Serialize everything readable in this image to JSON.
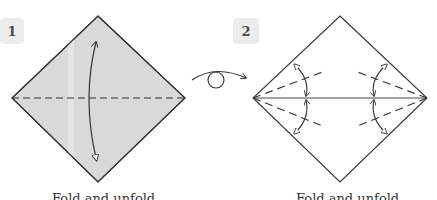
{
  "steps": [
    {
      "number": "1",
      "caption": "Fold and unfold",
      "paper_color": "#d9d9d9",
      "description": "Colored square diamond with horizontal valley-fold dashed line and a two-headed arrow indicating fold and unfold"
    },
    {
      "number": "2",
      "caption": "Fold and unfold",
      "paper_color": "#ffffff",
      "description": "White diamond with horizontal crease and four dashed valley lines from side corners, each with a two-headed fold/unfold arrow"
    }
  ],
  "turn_over_symbol": "turn-over-arrow",
  "colors": {
    "line": "#333333",
    "badge_bg": "#ececec",
    "badge_text": "#4a4a4a"
  }
}
